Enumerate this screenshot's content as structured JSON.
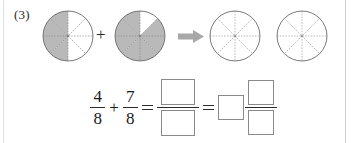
{
  "problem": {
    "number_label": "(3)"
  },
  "figures": {
    "total_parts": 8,
    "items": [
      {
        "name": "circle-1",
        "shaded_parts": 4,
        "shaded_sectors": [
          2,
          3,
          4,
          5
        ],
        "fill_color": "#b9b9b9",
        "outline_color": "#6e6e6e",
        "divider_style": "dashed"
      },
      {
        "name": "circle-2",
        "shaded_parts": 7,
        "shaded_sectors": [
          1,
          2,
          3,
          4,
          5,
          6,
          7
        ],
        "fill_color": "#b9b9b9",
        "outline_color": "#6e6e6e",
        "divider_style": "dashed"
      },
      {
        "name": "circle-3",
        "shaded_parts": 0,
        "shaded_sectors": [],
        "fill_color": "#ffffff",
        "outline_color": "#6e6e6e",
        "divider_style": "dashed"
      },
      {
        "name": "circle-4",
        "shaded_parts": 0,
        "shaded_sectors": [],
        "fill_color": "#ffffff",
        "outline_color": "#6e6e6e",
        "divider_style": "dashed"
      }
    ],
    "plus_symbol": "+",
    "arrow_symbol": "⇒",
    "arrow_color": "#a8a8a8"
  },
  "equation": {
    "fraction_1": {
      "numerator": "4",
      "denominator": "8"
    },
    "operator": "+",
    "fraction_2": {
      "numerator": "7",
      "denominator": "8"
    },
    "equals_1": "=",
    "answer_fraction": {
      "numerator": "",
      "denominator": ""
    },
    "equals_2": "=",
    "answer_mixed": {
      "whole": "",
      "numerator": "",
      "denominator": ""
    }
  },
  "colors": {
    "shade": "#b9b9b9",
    "outline": "#6e6e6e",
    "ink": "#1a1a1a",
    "box_border": "#8a8a8a",
    "frame": "#d8d8d8"
  }
}
